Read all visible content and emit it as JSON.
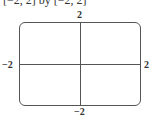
{
  "title": "[−2, 2] by [−2, 2]",
  "labels": {
    "y_max": "2",
    "y_min": "−2",
    "x_min": "−2",
    "x_max": "2"
  },
  "chart_data": {
    "type": "line",
    "title": "[−2, 2] by [−2, 2]",
    "xlabel": "",
    "ylabel": "",
    "xlim": [
      -2,
      2
    ],
    "ylim": [
      -2,
      2
    ],
    "tick_labels": {
      "x": [
        "−2",
        "2"
      ],
      "y": [
        "−2",
        "2"
      ]
    },
    "series": [],
    "grid": false,
    "legend": null,
    "annotations": [
      "Viewing window with axes crossing at origin"
    ]
  }
}
